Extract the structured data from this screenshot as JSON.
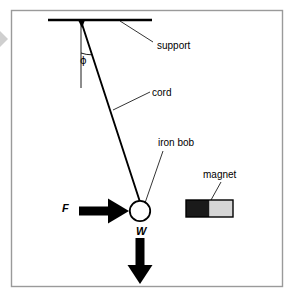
{
  "figure": {
    "background_color": "#ffffff",
    "frame": {
      "stroke": "#808080",
      "x": 11,
      "y": 10,
      "width": 272,
      "height": 277
    },
    "labels": {
      "support": "support",
      "cord": "cord",
      "iron_bob": "iron bob",
      "magnet": "magnet",
      "angle": "ϕ",
      "force": "F",
      "weight": "W"
    },
    "colors": {
      "ink": "#000000",
      "leader_line": "#000000",
      "magnet_north": "#1a1a1a",
      "magnet_south": "#d4d4d4",
      "bob_fill": "#ffffff",
      "frame": "#9a9a9a",
      "edge_marker": "#c8c8c8"
    },
    "geometry": {
      "pivot": {
        "x": 81,
        "y": 21
      },
      "support_bar": {
        "x1": 48,
        "y1": 20,
        "x2": 152,
        "y2": 20,
        "stroke_width": 2.5
      },
      "cord": {
        "x1": 81,
        "y1": 21,
        "x2": 140,
        "y2": 201,
        "stroke_width": 1.8
      },
      "vertical_reference": {
        "x1": 81,
        "y1": 21,
        "x2": 81,
        "y2": 88
      },
      "angle_arc_radius": 32,
      "bob": {
        "cx": 140,
        "cy": 211,
        "r": 10
      },
      "force_arrow": {
        "x1": 79,
        "y1": 211,
        "x2": 127,
        "y2": 211,
        "direction": "right"
      },
      "weight_arrow": {
        "x1": 140,
        "y1": 238,
        "x2": 140,
        "y2": 283,
        "direction": "down"
      },
      "magnet": {
        "x": 186,
        "y": 200,
        "width": 47,
        "height": 17
      }
    },
    "leaders": [
      {
        "name": "support-leader",
        "x1": 120,
        "y1": 21,
        "x2": 153,
        "y2": 42
      },
      {
        "name": "cord-leader",
        "x1": 113,
        "y1": 110,
        "x2": 150,
        "y2": 92
      },
      {
        "name": "ironbob-leader",
        "x1": 145,
        "y1": 203,
        "x2": 163,
        "y2": 150
      },
      {
        "name": "magnet-leader",
        "x1": 211,
        "y1": 201,
        "x2": 221,
        "y2": 181
      }
    ]
  }
}
